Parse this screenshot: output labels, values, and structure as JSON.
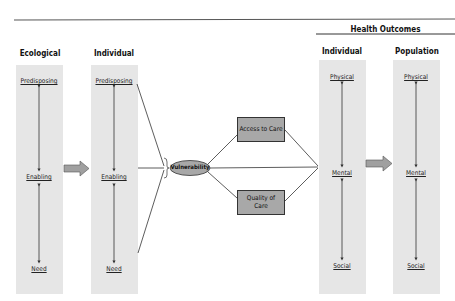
{
  "diagram": {
    "header_group": "Health Outcomes",
    "columns": [
      {
        "title": "Ecological",
        "labels": [
          "Predisposing",
          "Enabling",
          "Need"
        ]
      },
      {
        "title": "Individual",
        "labels": [
          "Predisposing",
          "Enabling",
          "Need"
        ]
      },
      {
        "title": "Individual",
        "labels": [
          "Physical",
          "Mental",
          "Social"
        ]
      },
      {
        "title": "Population",
        "labels": [
          "Physical",
          "Mental",
          "Social"
        ]
      }
    ],
    "center_node": "Vulnerability",
    "boxes": [
      {
        "label": "Access to Care"
      },
      {
        "label": "Quality of Care"
      }
    ],
    "colors": {
      "column_fill": "#e6e6e6",
      "box_fill": "#a8a8a8",
      "arrow_fill": "#a0a0a0",
      "line": "#333333"
    }
  }
}
